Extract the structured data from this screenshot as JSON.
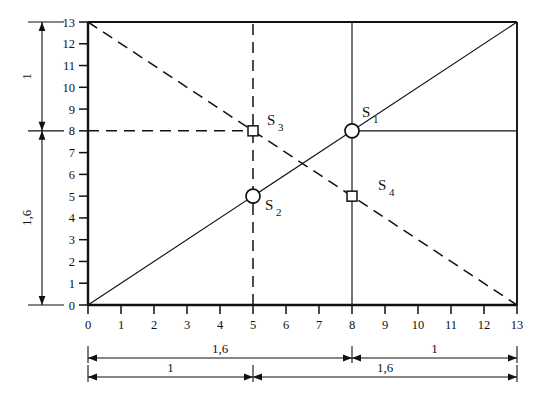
{
  "chart_data": {
    "type": "line",
    "title": "",
    "xlabel": "",
    "ylabel": "",
    "xlim": [
      0,
      13
    ],
    "ylim": [
      0,
      13
    ],
    "grid": false,
    "legend": "none",
    "x_ticks": [
      "0",
      "1",
      "2",
      "3",
      "4",
      "5",
      "6",
      "7",
      "8",
      "9",
      "10",
      "11",
      "12",
      "13"
    ],
    "y_ticks": [
      "0",
      "1",
      "2",
      "3",
      "4",
      "5",
      "6",
      "7",
      "8",
      "9",
      "10",
      "11",
      "12",
      "13"
    ],
    "series": [
      {
        "name": "rising-diagonal",
        "style": "solid",
        "points": [
          [
            0,
            0
          ],
          [
            13,
            13
          ]
        ]
      },
      {
        "name": "falling-diagonal",
        "style": "dashed",
        "points": [
          [
            0,
            13
          ],
          [
            13,
            0
          ]
        ]
      }
    ],
    "helper_lines": [
      {
        "name": "vertical-x5",
        "style": "dashed",
        "points": [
          [
            5,
            0
          ],
          [
            5,
            13
          ]
        ]
      },
      {
        "name": "vertical-x8",
        "style": "solid",
        "points": [
          [
            8,
            0
          ],
          [
            8,
            13
          ]
        ]
      },
      {
        "name": "horizontal-y8-left",
        "style": "dashed",
        "points": [
          [
            0,
            8
          ],
          [
            5,
            8
          ]
        ]
      },
      {
        "name": "horizontal-y8-right",
        "style": "solid",
        "points": [
          [
            8,
            8
          ],
          [
            13,
            8
          ]
        ]
      }
    ],
    "points": [
      {
        "label": "S",
        "sub": "1",
        "x": 8,
        "y": 8,
        "marker": "circle",
        "label_dx": 10,
        "label_dy": -14
      },
      {
        "label": "S",
        "sub": "2",
        "x": 5,
        "y": 5,
        "marker": "circle",
        "label_dx": 12,
        "label_dy": 14
      },
      {
        "label": "S",
        "sub": "3",
        "x": 5,
        "y": 8,
        "marker": "square",
        "label_dx": 14,
        "label_dy": -6
      },
      {
        "label": "S",
        "sub": "4",
        "x": 8,
        "y": 5,
        "marker": "square",
        "label_dx": 26,
        "label_dy": -6
      }
    ],
    "dimensions": {
      "vertical": [
        {
          "name": "vert-upper",
          "label": "1",
          "from": 8,
          "to": 13
        },
        {
          "name": "vert-lower",
          "label": "1,6",
          "from": 0,
          "to": 8
        }
      ],
      "horizontal_upper": [
        {
          "name": "horiz-upper-left",
          "label": "1,6",
          "from": 0,
          "to": 8
        },
        {
          "name": "horiz-upper-right",
          "label": "1",
          "from": 8,
          "to": 13
        }
      ],
      "horizontal_lower": [
        {
          "name": "horiz-lower-left",
          "label": "1",
          "from": 0,
          "to": 5
        },
        {
          "name": "horiz-lower-right",
          "label": "1,6",
          "from": 5,
          "to": 13
        }
      ]
    },
    "colors": {
      "ink": "#111111",
      "background": "#ffffff"
    }
  }
}
